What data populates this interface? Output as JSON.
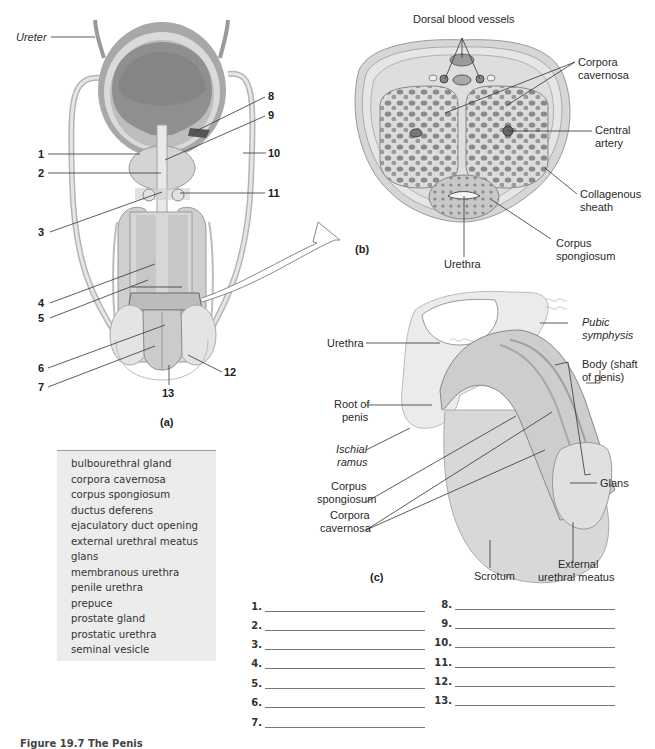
{
  "figure": {
    "caption": "Figure 19.7 The Penis",
    "panels": {
      "a": {
        "tag": "(a)",
        "labels": {
          "ureter": "Ureter",
          "numbers": [
            "1",
            "2",
            "3",
            "4",
            "5",
            "6",
            "7",
            "8",
            "9",
            "10",
            "11",
            "12",
            "13"
          ]
        }
      },
      "b": {
        "tag": "(b)",
        "labels": {
          "dorsal_vessels": "Dorsal blood vessels",
          "corpora_cavernosa": [
            "Corpora",
            "cavernosa"
          ],
          "central_artery": [
            "Central",
            "artery"
          ],
          "collagenous_sheath": [
            "Collagenous",
            "sheath"
          ],
          "corpus_spongiosum": [
            "Corpus",
            "spongiosum"
          ],
          "urethra": "Urethra"
        }
      },
      "c": {
        "tag": "(c)",
        "labels": {
          "urethra": "Urethra",
          "pubic_symphysis": [
            "Pubic",
            "symphysis"
          ],
          "body_shaft": [
            "Body (shaft",
            "of penis)"
          ],
          "root_of_penis": [
            "Root of",
            "penis"
          ],
          "ischial_ramus": [
            "Ischial",
            "ramus"
          ],
          "corpus_spongiosum": [
            "Corpus",
            "spongiosum"
          ],
          "corpora_cavernosa": [
            "Corpora",
            "cavernosa"
          ],
          "glans": "Glans",
          "scrotum": "Scrotum",
          "external_urethral_meatus": [
            "External",
            "urethral meatus"
          ]
        }
      }
    }
  },
  "word_bank": [
    "bulbourethral gland",
    "corpora cavernosa",
    "corpus spongiosum",
    "ductus deferens",
    "ejaculatory duct opening",
    "external urethral meatus",
    "glans",
    "membranous urethra",
    "penile urethra",
    "prepuce",
    "prostate gland",
    "prostatic urethra",
    "seminal vesicle"
  ],
  "answer_blanks": {
    "left": [
      {
        "n": "1.",
        "value": ""
      },
      {
        "n": "2.",
        "value": ""
      },
      {
        "n": "3.",
        "value": ""
      },
      {
        "n": "4.",
        "value": ""
      },
      {
        "n": "5.",
        "value": ""
      },
      {
        "n": "6.",
        "value": ""
      },
      {
        "n": "7.",
        "value": ""
      }
    ],
    "right": [
      {
        "n": "8.",
        "value": ""
      },
      {
        "n": "9.",
        "value": ""
      },
      {
        "n": "10.",
        "value": ""
      },
      {
        "n": "11.",
        "value": ""
      },
      {
        "n": "12.",
        "value": ""
      },
      {
        "n": "13.",
        "value": ""
      }
    ]
  },
  "colors": {
    "tissue_light": "#e2e2e2",
    "tissue_mid": "#c4c4c4",
    "tissue_dark": "#8e8e8e",
    "wordbank_bg": "#ececec",
    "leader_line": "#333333"
  }
}
